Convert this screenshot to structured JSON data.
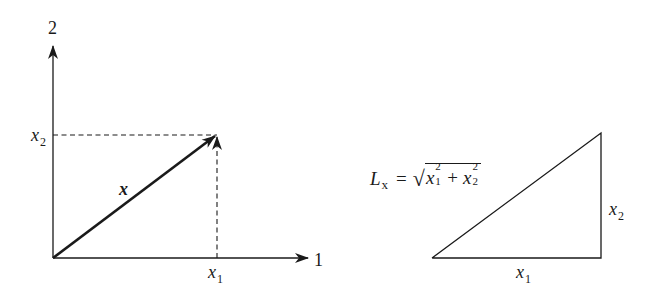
{
  "figure": {
    "left_panel": {
      "axis_vertical_label": "2",
      "axis_horizontal_label": "1",
      "vector_label": "x",
      "x2_label": {
        "base": "x",
        "sub": "2"
      },
      "x1_label": {
        "base": "x",
        "sub": "1"
      }
    },
    "right_panel": {
      "formula": {
        "lhs_base": "L",
        "lhs_sub": "x",
        "equals": "=",
        "sqrt_symbol": "√",
        "term1": {
          "base": "x",
          "sup": "2",
          "sub": "1"
        },
        "plus": "+",
        "term2": {
          "base": "x",
          "sup": "2",
          "sub": "2"
        }
      },
      "side_vertical_label": {
        "base": "x",
        "sub": "2"
      },
      "side_horizontal_label": {
        "base": "x",
        "sub": "1"
      }
    },
    "colors": {
      "stroke": "#1a1a1a",
      "background": "#ffffff"
    }
  }
}
